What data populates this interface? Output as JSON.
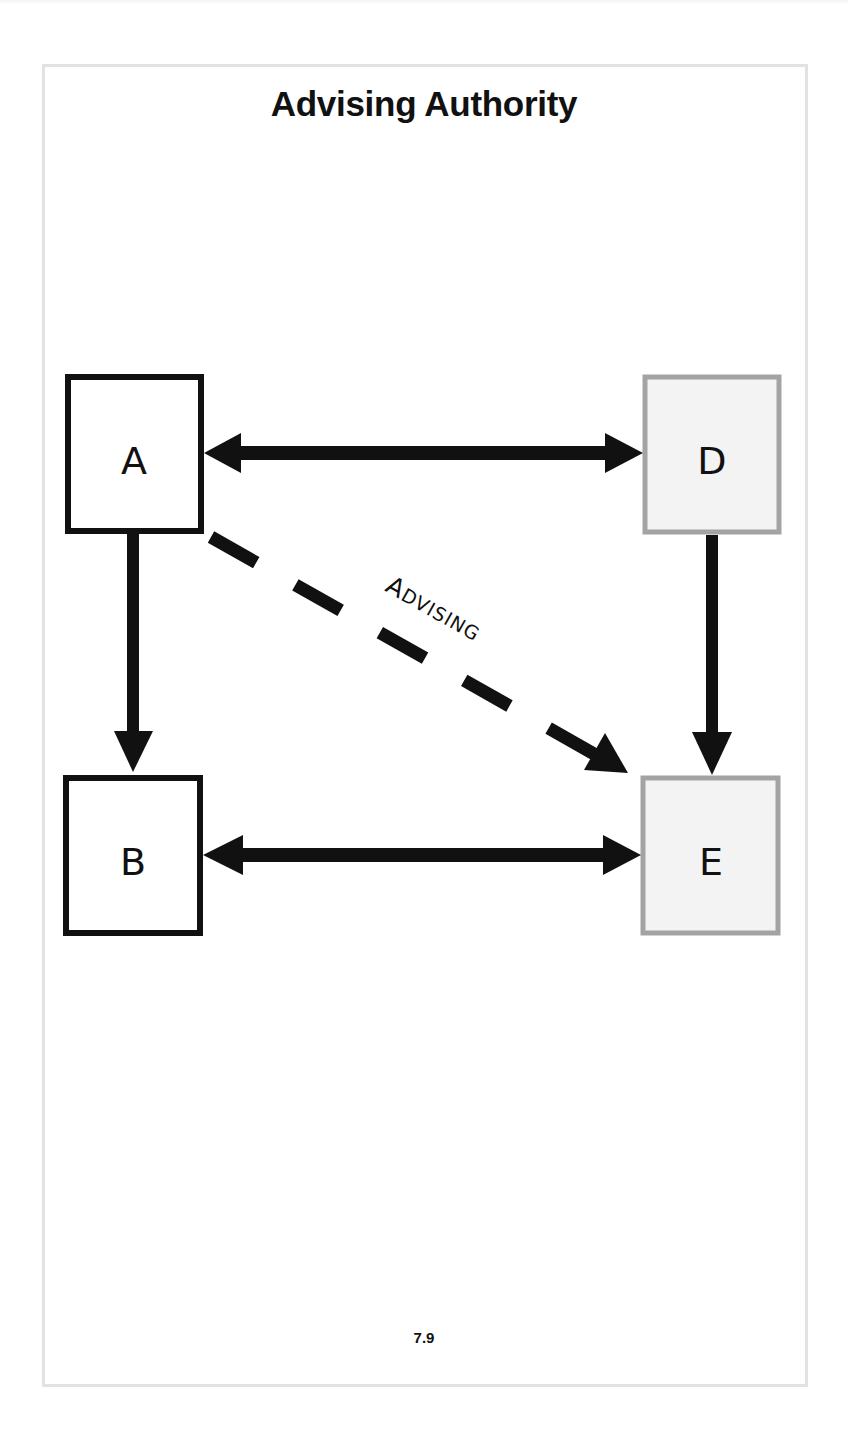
{
  "page": {
    "title": "Advising Authority",
    "page_number": "7.9"
  },
  "diagram": {
    "nodes": [
      {
        "id": "A",
        "label": "A",
        "style": "solid-black"
      },
      {
        "id": "B",
        "label": "B",
        "style": "solid-black"
      },
      {
        "id": "D",
        "label": "D",
        "style": "gray-shaded"
      },
      {
        "id": "E",
        "label": "E",
        "style": "gray-shaded"
      }
    ],
    "edges": [
      {
        "from": "A",
        "to": "D",
        "type": "bidirectional",
        "line": "solid"
      },
      {
        "from": "A",
        "to": "B",
        "type": "directed",
        "line": "solid"
      },
      {
        "from": "D",
        "to": "E",
        "type": "directed",
        "line": "solid"
      },
      {
        "from": "B",
        "to": "E",
        "type": "bidirectional",
        "line": "solid"
      },
      {
        "from": "A",
        "to": "E",
        "type": "directed",
        "line": "dashed",
        "label": "ADVISING"
      }
    ],
    "advising_label": {
      "first": "A",
      "rest": "DVISING"
    },
    "colors": {
      "black": "#111111",
      "gray_border": "#a3a3a3",
      "gray_fill": "#f3f3f3"
    }
  }
}
